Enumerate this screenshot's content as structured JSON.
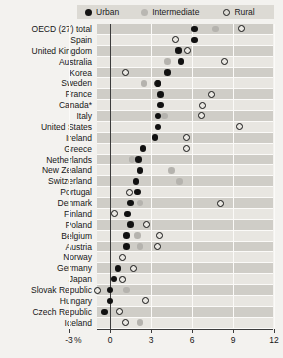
{
  "legend": {
    "entries": [
      {
        "label": "Urban",
        "marker": "filled-circle-black",
        "color": "#141414"
      },
      {
        "label": "Intermediate",
        "marker": "filled-circle-gray",
        "color": "#b9b7b2"
      },
      {
        "label": "Rural",
        "marker": "open-circle",
        "color": "#1a1a1a"
      }
    ]
  },
  "axis": {
    "unit_label": "%",
    "ticks": [
      "-3",
      "0",
      "3",
      "6",
      "9",
      "12"
    ]
  },
  "chart_data": {
    "type": "scatter",
    "title": "",
    "subtitle": "",
    "xlabel": "%",
    "ylabel": "",
    "xlim": [
      -3,
      12
    ],
    "xticks": [
      -3,
      0,
      3,
      6,
      9,
      12
    ],
    "grid": true,
    "legend_position": "top",
    "orientation": "horizontal-dotplot",
    "categories": [
      "OECD (27) total",
      "Spain",
      "United Kingdom",
      "Australia",
      "Korea",
      "Sweden",
      "France",
      "Canada*",
      "Italy",
      "United States",
      "Ireland",
      "Greece",
      "Netherlands",
      "New Zealand",
      "Switzerland",
      "Portugal",
      "Denmark",
      "Finland",
      "Poland",
      "Belgium",
      "Austria",
      "Norway",
      "Germany",
      "Japan",
      "Slovak Republic",
      "Hungary",
      "Czech Republic",
      "Iceland"
    ],
    "series": [
      {
        "name": "Urban",
        "marker": "filled-circle-black",
        "values": [
          6.2,
          6.2,
          5.0,
          5.2,
          4.2,
          3.5,
          3.7,
          3.7,
          3.5,
          3.5,
          3.3,
          2.4,
          2.1,
          2.2,
          1.9,
          2.0,
          1.5,
          1.3,
          1.5,
          1.2,
          1.2,
          null,
          0.6,
          0.3,
          0.0,
          0.0,
          -0.4,
          null
        ]
      },
      {
        "name": "Intermediate",
        "marker": "filled-circle-gray",
        "values": [
          7.7,
          null,
          5.0,
          4.2,
          null,
          2.5,
          null,
          null,
          4.0,
          null,
          null,
          null,
          1.6,
          4.5,
          5.1,
          null,
          2.2,
          null,
          null,
          2.0,
          2.2,
          null,
          null,
          0.9,
          1.2,
          null,
          null,
          2.2
        ]
      },
      {
        "name": "Rural",
        "marker": "open-circle",
        "values": [
          9.6,
          4.8,
          5.7,
          8.4,
          1.1,
          3.5,
          7.4,
          6.8,
          6.7,
          9.5,
          5.6,
          5.6,
          null,
          null,
          null,
          1.4,
          8.1,
          0.3,
          2.7,
          3.6,
          3.5,
          0.9,
          1.7,
          0.9,
          -0.9,
          2.6,
          0.7,
          1.1
        ]
      }
    ]
  }
}
